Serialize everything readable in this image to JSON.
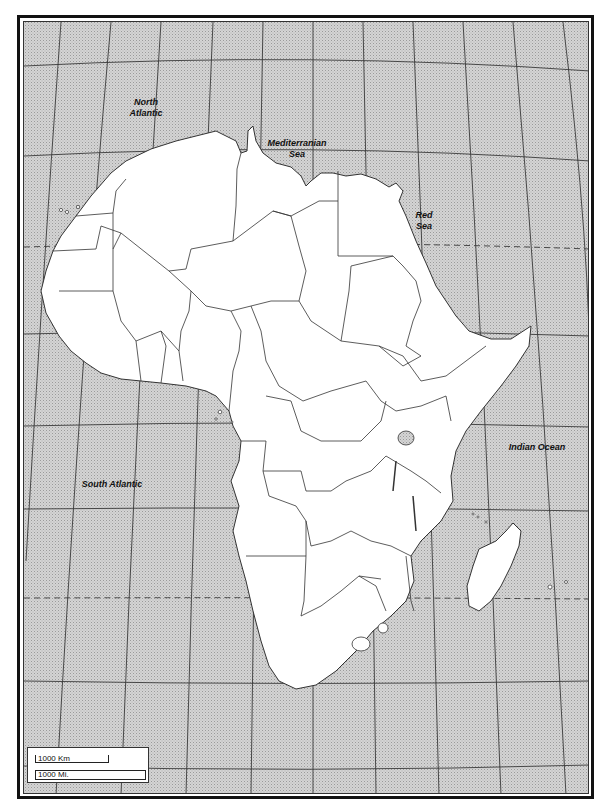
{
  "map": {
    "title": "Africa outline map",
    "colors": {
      "ocean": "#c9c9c9",
      "land": "#ffffff",
      "border": "#333333",
      "graticule": "#3a3a3a",
      "frame": "#111111"
    },
    "water_labels": [
      {
        "id": "north-atlantic",
        "line1": "North",
        "line2": "Atlantic"
      },
      {
        "id": "mediterranean-sea",
        "line1": "Mediterranian",
        "line2": "Sea"
      },
      {
        "id": "red-sea",
        "line1": "Red",
        "line2": "Sea"
      },
      {
        "id": "indian-ocean",
        "line1": "Indian Ocean",
        "line2": ""
      },
      {
        "id": "south-atlantic",
        "line1": "South Atlantic",
        "line2": ""
      }
    ],
    "scale": {
      "km_label": "1000 Km",
      "mi_label": "1000 Mi."
    }
  }
}
